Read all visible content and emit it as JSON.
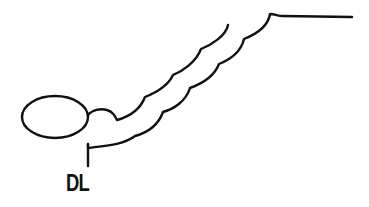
{
  "diagram": {
    "label": "DL",
    "stroke_color": "#111111",
    "background": "#ffffff",
    "elements": [
      {
        "type": "ellipse",
        "name": "oval-body",
        "cx": 55,
        "cy": 117,
        "rx": 33,
        "ry": 21
      },
      {
        "type": "scalloped-curve",
        "name": "upper-scalloped-curve",
        "start": [
          88,
          115
        ],
        "end": [
          228,
          25
        ],
        "cusps": [
          [
            117,
            120
          ],
          [
            145,
            97
          ],
          [
            173,
            75
          ],
          [
            201,
            49
          ]
        ]
      },
      {
        "type": "scalloped-curve",
        "name": "lower-scalloped-curve",
        "start": [
          88,
          144
        ],
        "end": [
          352,
          17
        ],
        "cusps": [
          [
            135,
            136
          ],
          [
            163,
            112
          ],
          [
            190,
            88
          ],
          [
            219,
            64
          ],
          [
            244,
            39
          ],
          [
            270,
            14
          ]
        ]
      },
      {
        "type": "line",
        "name": "dl-leader-line",
        "from": [
          88,
          144
        ],
        "to": [
          88,
          166
        ]
      }
    ]
  }
}
